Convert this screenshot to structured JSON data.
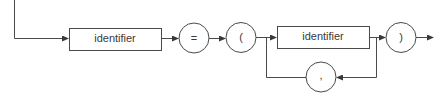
{
  "diagram": {
    "type": "railroad-syntax-diagram",
    "stroke_color": "#4a4a4a",
    "nodes": [
      {
        "id": "n1",
        "kind": "nonterminal",
        "label": "identifier"
      },
      {
        "id": "n2",
        "kind": "terminal",
        "label": "="
      },
      {
        "id": "n3",
        "kind": "terminal",
        "label": "("
      },
      {
        "id": "n4",
        "kind": "nonterminal",
        "label": "identifier"
      },
      {
        "id": "n5",
        "kind": "terminal",
        "label": ")"
      },
      {
        "id": "n6",
        "kind": "terminal",
        "label": ","
      }
    ],
    "edges": [
      {
        "from": "entry",
        "to": "n1"
      },
      {
        "from": "n1",
        "to": "n2"
      },
      {
        "from": "n2",
        "to": "n3"
      },
      {
        "from": "n3",
        "to": "n4"
      },
      {
        "from": "n4",
        "to": "n5"
      },
      {
        "from": "n4",
        "to": "n6",
        "note": "repeat loop"
      },
      {
        "from": "n6",
        "to": "n4"
      },
      {
        "from": "n5",
        "to": "exit"
      }
    ]
  }
}
